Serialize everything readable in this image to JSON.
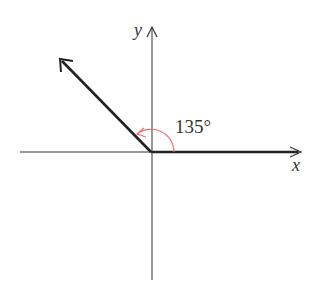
{
  "diagram": {
    "type": "angle-in-standard-position",
    "angle_label": "135°",
    "angle_degrees": 135,
    "x_axis_label": "x",
    "y_axis_label": "y",
    "colors": {
      "axes": "#333333",
      "terminal_side": "#222222",
      "arc": "#f07070"
    }
  }
}
